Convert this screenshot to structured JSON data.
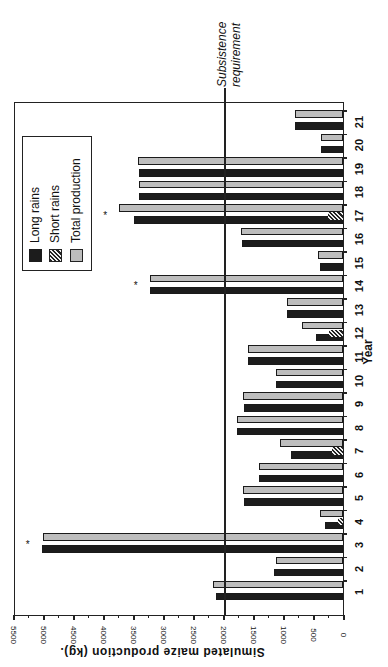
{
  "chart_data": {
    "type": "bar",
    "orientation": "rotated 90° (value axis horizontal at bottom, reading right-to-left; years along right edge)",
    "title": "",
    "xlabel": "Year",
    "ylabel": "Simulated maize production (kg).",
    "ylim": [
      0,
      5500
    ],
    "yticks": [
      "0",
      "500",
      "1000",
      "1500",
      "2000",
      "2500",
      "3000",
      "3500",
      "4000",
      "4500",
      "5000",
      "5500"
    ],
    "categories": [
      "1",
      "2",
      "3",
      "4",
      "5",
      "6",
      "7",
      "8",
      "9",
      "10",
      "11",
      "12",
      "13",
      "14",
      "15",
      "16",
      "17",
      "18",
      "19",
      "20",
      "21"
    ],
    "series": [
      {
        "name": "Long rains",
        "values": [
          2120,
          1150,
          5020,
          300,
          1650,
          1400,
          870,
          1770,
          1650,
          1120,
          1580,
          450,
          930,
          3220,
          380,
          1680,
          3480,
          3400,
          3400,
          370,
          800
        ]
      },
      {
        "name": "Short rains",
        "values": [
          0,
          0,
          0,
          80,
          0,
          0,
          180,
          0,
          0,
          0,
          0,
          230,
          0,
          0,
          0,
          0,
          250,
          0,
          0,
          0,
          0
        ]
      },
      {
        "name": "Total production",
        "values": [
          2170,
          1120,
          5000,
          380,
          1670,
          1400,
          1050,
          1770,
          1670,
          1120,
          1580,
          680,
          930,
          3220,
          420,
          1700,
          3730,
          3400,
          3420,
          370,
          800
        ]
      }
    ],
    "reference_line": {
      "label": "Subsistence requirement",
      "value": 2000
    },
    "annotations": [
      {
        "text": "*",
        "year": "3"
      },
      {
        "text": "*",
        "year": "14"
      },
      {
        "text": "*",
        "year": "17"
      }
    ],
    "legend": {
      "position": "upper-left (rotated view)",
      "entries": [
        "Long rains",
        "Short rains",
        "Total production"
      ]
    },
    "grid": false
  },
  "labels": {
    "subsistence_line1": "Subsistence",
    "subsistence_line2": "requirement",
    "x_axis_title": "Year",
    "y_axis_title": "Simulated maize production (kg).",
    "legend_long": "Long rains",
    "legend_short": "Short rains",
    "legend_total": "Total production",
    "asterisk": "*"
  }
}
